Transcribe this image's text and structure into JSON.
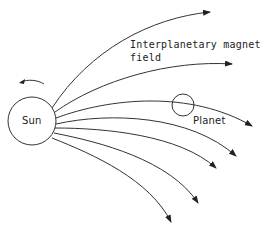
{
  "diagram": {
    "labels": {
      "sun": "Sun",
      "planet": "Planet",
      "field_line1": "Interplanetary magnetic",
      "field_line2": "field"
    },
    "colors": {
      "stroke": "#333333",
      "text": "#222222",
      "background": "#ffffff"
    },
    "sun": {
      "cx": 32,
      "cy": 121,
      "r": 24
    },
    "planet": {
      "cx": 183,
      "cy": 105,
      "r": 11
    },
    "rotation_direction": "counterclockwise",
    "field_lines": [
      {
        "d": "M52,108 C90,50 150,18 210,12",
        "tip": [
          210,
          12
        ],
        "angle": -4
      },
      {
        "d": "M55,112 C100,80 170,60 232,64",
        "tip": [
          232,
          64
        ],
        "angle": 3
      },
      {
        "d": "M56,118 C110,98 190,90 252,126",
        "tip": [
          252,
          126
        ],
        "angle": 28
      },
      {
        "d": "M56,124 C110,112 190,115 236,156",
        "tip": [
          236,
          156
        ],
        "angle": 42
      },
      {
        "d": "M55,128 C105,128 180,135 216,168",
        "tip": [
          216,
          168
        ],
        "angle": 45
      },
      {
        "d": "M54,133 C100,142 170,160 198,203",
        "tip": [
          198,
          203
        ],
        "angle": 58
      },
      {
        "d": "M52,138 C95,155 150,180 171,222",
        "tip": [
          171,
          222
        ],
        "angle": 64
      }
    ]
  }
}
